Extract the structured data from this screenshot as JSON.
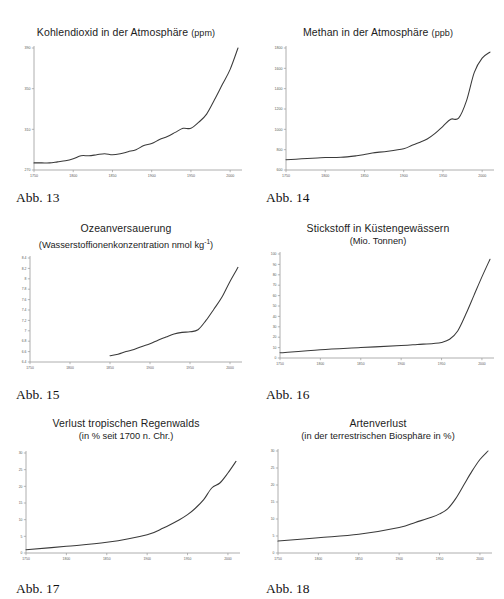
{
  "page": {
    "background": "#ffffff",
    "line_color": "#3a3a3a",
    "axis_color": "#9a9a9a",
    "text_color": "#1c1c1c"
  },
  "figures": [
    {
      "caption": "Abb. 13",
      "title": "Kohlendioxid in der Atmosphäre",
      "unit": "(ppm)",
      "subtitle": ""
    },
    {
      "caption": "Abb. 14",
      "title": "Methan in der Atmosphäre",
      "unit": "(ppb)",
      "subtitle": ""
    },
    {
      "caption": "Abb. 15",
      "title": "Ozeanversauerung",
      "unit": "",
      "subtitle": "(Wasserstoffionenkonzentration nmol kg"
    },
    {
      "caption": "Abb. 16",
      "title": "Stickstoff in Küstengewässern",
      "unit": "",
      "subtitle": "(Mio. Tonnen)"
    },
    {
      "caption": "Abb. 17",
      "title": "Verlust tropischen Regenwalds",
      "unit": "",
      "subtitle": "(in % seit 1700 n. Chr.)"
    },
    {
      "caption": "Abb. 18",
      "title": "Artenverlust",
      "unit": "",
      "subtitle": "(in der terrestrischen Biosphäre in %)"
    }
  ],
  "chart_data": [
    {
      "type": "line",
      "title": "Kohlendioxid in der Atmosphäre (ppm)",
      "xlabel": "",
      "ylabel": "ppm",
      "xlim": [
        1750,
        2010
      ],
      "ylim": [
        270,
        390
      ],
      "xticks": [
        1750,
        1800,
        1850,
        1900,
        1950,
        2000
      ],
      "yticks": [
        270,
        310,
        350,
        390
      ],
      "grid": false,
      "legend": "none",
      "x": [
        1750,
        1760,
        1770,
        1780,
        1790,
        1800,
        1810,
        1820,
        1830,
        1840,
        1850,
        1860,
        1870,
        1880,
        1890,
        1900,
        1910,
        1920,
        1930,
        1940,
        1950,
        1960,
        1970,
        1980,
        1990,
        2000,
        2010
      ],
      "values": [
        277,
        277,
        277,
        278,
        279,
        281,
        284,
        284,
        285,
        286,
        285,
        286,
        288,
        290,
        294,
        296,
        300,
        303,
        307,
        311,
        311,
        317,
        325,
        339,
        354,
        369,
        390
      ]
    },
    {
      "type": "line",
      "title": "Methan in der Atmosphäre (ppb)",
      "xlabel": "",
      "ylabel": "ppb",
      "xlim": [
        1750,
        2010
      ],
      "ylim": [
        600,
        1800
      ],
      "xticks": [
        1750,
        1800,
        1850,
        1900,
        1950,
        2000
      ],
      "yticks": [
        600,
        800,
        1000,
        1200,
        1400,
        1600,
        1800
      ],
      "grid": false,
      "legend": "none",
      "x": [
        1750,
        1770,
        1790,
        1800,
        1820,
        1840,
        1850,
        1860,
        1880,
        1900,
        1910,
        1920,
        1930,
        1940,
        1950,
        1960,
        1970,
        1980,
        1990,
        2000,
        2010
      ],
      "values": [
        700,
        710,
        718,
        722,
        725,
        740,
        752,
        768,
        785,
        810,
        840,
        870,
        905,
        960,
        1030,
        1100,
        1110,
        1280,
        1560,
        1700,
        1760
      ]
    },
    {
      "type": "line",
      "title": "Ozeanversauerung (Wasserstoffionenkonzentration nmol kg⁻¹)",
      "xlabel": "",
      "ylabel": "nmol kg-1",
      "xlim": [
        1750,
        2010
      ],
      "ylim": [
        6.4,
        8.4
      ],
      "xticks": [
        1750,
        1800,
        1850,
        1900,
        1950,
        2000
      ],
      "yticks": [
        6.4,
        6.6,
        6.8,
        7.0,
        7.2,
        7.4,
        7.6,
        7.8,
        8.0,
        8.2,
        8.4
      ],
      "grid": false,
      "legend": "none",
      "x": [
        1850,
        1860,
        1870,
        1880,
        1890,
        1900,
        1910,
        1920,
        1930,
        1940,
        1950,
        1960,
        1970,
        1980,
        1990,
        2000,
        2010
      ],
      "values": [
        6.52,
        6.55,
        6.6,
        6.64,
        6.7,
        6.75,
        6.82,
        6.88,
        6.94,
        6.97,
        6.98,
        7.02,
        7.2,
        7.42,
        7.65,
        7.95,
        8.22
      ]
    },
    {
      "type": "line",
      "title": "Stickstoff in Küstengewässern (Mio. Tonnen)",
      "xlabel": "",
      "ylabel": "Mio. Tonnen",
      "xlim": [
        1750,
        2010
      ],
      "ylim": [
        0,
        100
      ],
      "xticks": [
        1750,
        1800,
        1850,
        1900,
        1950,
        2000
      ],
      "yticks": [
        0,
        10,
        20,
        30,
        40,
        50,
        60,
        70,
        80,
        90,
        100
      ],
      "grid": false,
      "legend": "none",
      "x": [
        1750,
        1800,
        1850,
        1900,
        1920,
        1940,
        1950,
        1960,
        1970,
        1980,
        1990,
        2000,
        2010
      ],
      "values": [
        5,
        8,
        10,
        12,
        13,
        14,
        15,
        18,
        26,
        42,
        60,
        78,
        95
      ]
    },
    {
      "type": "line",
      "title": "Verlust tropischen Regenwalds (in % seit 1700 n. Chr.)",
      "xlabel": "",
      "ylabel": "%",
      "xlim": [
        1750,
        2010
      ],
      "ylim": [
        0,
        30
      ],
      "xticks": [
        1750,
        1800,
        1850,
        1900,
        1950,
        2000
      ],
      "yticks": [
        0,
        5,
        10,
        15,
        20,
        25,
        30
      ],
      "grid": false,
      "legend": "none",
      "x": [
        1750,
        1800,
        1850,
        1900,
        1920,
        1940,
        1950,
        1960,
        1970,
        1980,
        1990,
        2000,
        2010
      ],
      "values": [
        1,
        2,
        3.2,
        5.5,
        7.5,
        10,
        11.5,
        13.5,
        16,
        19.5,
        21,
        24,
        27.5
      ]
    },
    {
      "type": "line",
      "title": "Artenverlust (in der terrestrischen Biosphäre in %)",
      "xlabel": "",
      "ylabel": "%",
      "xlim": [
        1750,
        2010
      ],
      "ylim": [
        0,
        30
      ],
      "xticks": [
        1750,
        1800,
        1850,
        1900,
        1950,
        2000
      ],
      "yticks": [
        0,
        5,
        10,
        15,
        20,
        25,
        30
      ],
      "grid": false,
      "legend": "none",
      "x": [
        1750,
        1800,
        1850,
        1900,
        1920,
        1940,
        1950,
        1960,
        1970,
        1980,
        1990,
        2000,
        2010
      ],
      "values": [
        3.5,
        4.5,
        5.5,
        7.5,
        9,
        10.5,
        11.5,
        13,
        16,
        20,
        24,
        27.5,
        30
      ]
    }
  ]
}
